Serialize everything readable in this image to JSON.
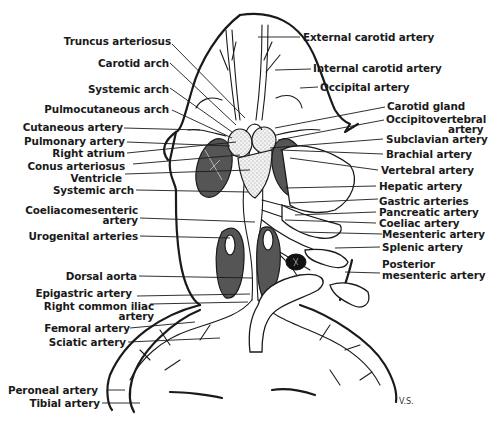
{
  "diagram": {
    "signature": "V.S.",
    "colors": {
      "ink": "#1a1a1a",
      "dark_fill": "#555555",
      "stipple_fill": "#e6e6e6",
      "background": "#ffffff"
    },
    "labels_left": [
      {
        "id": "truncus",
        "text": "Truncus arteriosus"
      },
      {
        "id": "carotid_arch",
        "text": "Carotid arch"
      },
      {
        "id": "systemic_arch_top",
        "text": "Systemic arch"
      },
      {
        "id": "pulmocutaneous",
        "text": "Pulmocutaneous arch"
      },
      {
        "id": "cutaneous",
        "text": "Cutaneous artery"
      },
      {
        "id": "pulmonary",
        "text": "Pulmonary artery"
      },
      {
        "id": "right_atrium",
        "text": "Right atrium"
      },
      {
        "id": "conus",
        "text": "Conus arteriosus"
      },
      {
        "id": "ventricle",
        "text": "Ventricle"
      },
      {
        "id": "systemic_arch_low",
        "text": "Systemic arch"
      },
      {
        "id": "coeliacomesenteric_1",
        "text": "Coeliacomesenteric"
      },
      {
        "id": "coeliacomesenteric_2",
        "text": "artery"
      },
      {
        "id": "urogenital",
        "text": "Urogenital arteries"
      },
      {
        "id": "dorsal_aorta",
        "text": "Dorsal aorta"
      },
      {
        "id": "epigastric",
        "text": "Epigastric artery"
      },
      {
        "id": "right_common_iliac_1",
        "text": "Right common iliac"
      },
      {
        "id": "right_common_iliac_2",
        "text": "artery"
      },
      {
        "id": "femoral",
        "text": "Femoral artery"
      },
      {
        "id": "sciatic",
        "text": "Sciatic artery"
      },
      {
        "id": "peroneal",
        "text": "Peroneal artery"
      },
      {
        "id": "tibial",
        "text": "Tibial artery"
      }
    ],
    "labels_right": [
      {
        "id": "external_carotid",
        "text": "External carotid artery"
      },
      {
        "id": "internal_carotid",
        "text": "Internal carotid artery"
      },
      {
        "id": "occipital",
        "text": "Occipital artery"
      },
      {
        "id": "carotid_gland",
        "text": "Carotid gland"
      },
      {
        "id": "occipitovertebral_1",
        "text": "Occipitovertebral"
      },
      {
        "id": "occipitovertebral_2",
        "text": "artery"
      },
      {
        "id": "subclavian",
        "text": "Subclavian artery"
      },
      {
        "id": "brachial",
        "text": "Brachial artery"
      },
      {
        "id": "vertebral",
        "text": "Vertebral artery"
      },
      {
        "id": "hepatic",
        "text": "Hepatic artery"
      },
      {
        "id": "gastric",
        "text": "Gastric arteries"
      },
      {
        "id": "pancreatic",
        "text": "Pancreatic artery"
      },
      {
        "id": "coeliac",
        "text": "Coeliac artery"
      },
      {
        "id": "mesenteric",
        "text": "Mesenteric artery"
      },
      {
        "id": "splenic",
        "text": "Splenic artery"
      },
      {
        "id": "posterior_mesenteric_1",
        "text": "Posterior"
      },
      {
        "id": "posterior_mesenteric_2",
        "text": "mesenteric artery"
      }
    ]
  }
}
